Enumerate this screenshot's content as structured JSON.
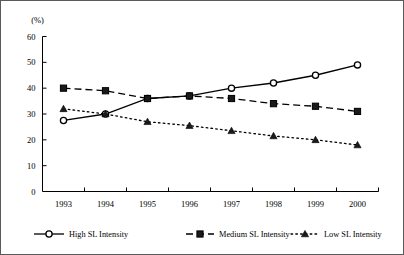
{
  "chart_data": {
    "type": "line",
    "title": "",
    "xlabel": "",
    "ylabel": "",
    "unit_label": "(%)",
    "categories": [
      "1993",
      "1994",
      "1995",
      "1996",
      "1997",
      "1998",
      "1999",
      "2000"
    ],
    "ylim": [
      0,
      60
    ],
    "ytick_values": [
      0,
      10,
      20,
      30,
      40,
      50,
      60
    ],
    "ytick_labels": [
      "0",
      "10",
      "20",
      "30",
      "40",
      "50",
      "60"
    ],
    "grid": false,
    "legend_position": "bottom",
    "series": [
      {
        "name": "High SL Intensity",
        "marker": "open-circle",
        "line_style": "solid",
        "values": [
          27.5,
          30,
          36,
          37,
          40,
          42,
          45,
          49
        ]
      },
      {
        "name": "Medium SL Intensity",
        "marker": "filled-square",
        "line_style": "dashed",
        "values": [
          40,
          39,
          36,
          37,
          36,
          34,
          33,
          31
        ]
      },
      {
        "name": "Low SL Intensity",
        "marker": "filled-triangle",
        "line_style": "dotted",
        "values": [
          32,
          30,
          27,
          25.5,
          23.5,
          21.5,
          20,
          18
        ]
      }
    ]
  },
  "legend": {
    "items": [
      {
        "label": "High SL Intensity"
      },
      {
        "label": "Medium SL Intensity"
      },
      {
        "label": "Low SL Intensity"
      }
    ]
  },
  "colors": {
    "ink": "#000000",
    "frame": "#5a5a5a",
    "background": "#ffffff",
    "marker_fill": "#1a1a1a"
  }
}
